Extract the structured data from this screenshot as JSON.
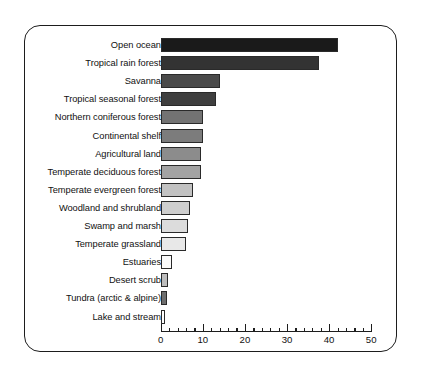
{
  "chart_data": {
    "type": "bar",
    "orientation": "horizontal",
    "title": "",
    "xlabel": "",
    "ylabel": "",
    "xlim": [
      0,
      50
    ],
    "grid": false,
    "legend": null,
    "major_tick_step": 10,
    "minor_tick_step": 2,
    "xticks": [
      0,
      10,
      20,
      30,
      40,
      50
    ],
    "xtick_labels": [
      "0",
      "10",
      "20",
      "30",
      "40",
      "50"
    ],
    "categories": [
      "Open ocean",
      "Tropical rain forest",
      "Savanna",
      "Tropical seasonal forest",
      "Northern coniferous forest",
      "Continental shelf",
      "Agricultural land",
      "Temperate deciduous forest",
      "Temperate evergreen forest",
      "Woodland and shrubland",
      "Swamp and marsh",
      "Temperate grassland",
      "Estuaries",
      "Desert scrub",
      "Tundra (arctic & alpine)",
      "Lake and stream"
    ],
    "values": [
      42,
      37.5,
      14,
      13,
      10,
      10,
      9.5,
      9.5,
      7.5,
      7,
      6.5,
      6,
      2.5,
      1.6,
      1.5,
      0.8
    ],
    "bar_colors": [
      "#1a1a1a",
      "#333333",
      "#4a4a4a",
      "#3f3f3f",
      "#737373",
      "#7c7c7c",
      "#8c8c8c",
      "#a3a3a3",
      "#c2c2c2",
      "#cecece",
      "#dcdcdc",
      "#e8e8e8",
      "#fbfbfb",
      "#bdbdbd",
      "#6e6e6e",
      "#ffffff"
    ],
    "bar_edge_color": "#2a2a2a",
    "axis_color": "#1d1d1d",
    "background_color": "#ffffff",
    "frame_color": "#1d1d1d"
  }
}
